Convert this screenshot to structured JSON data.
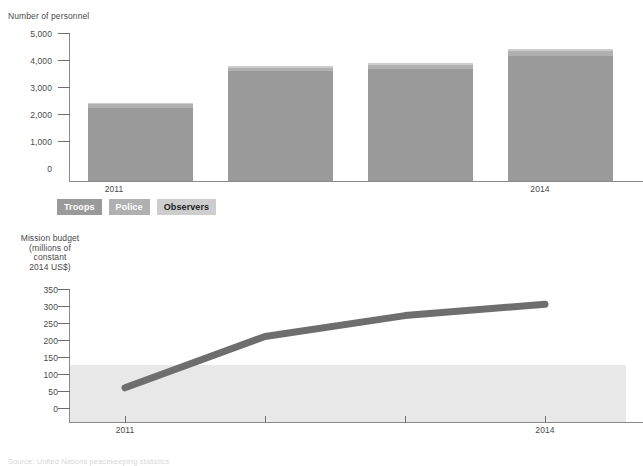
{
  "figure": {
    "source_note": "Source: United Nations peacekeeping statistics"
  },
  "bar_chart": {
    "ylabel": "Number of personnel",
    "yticks": [
      "5,000",
      "4,000",
      "3,000",
      "2,000",
      "1,000",
      "0"
    ],
    "xticks": [
      "2011",
      "",
      "",
      "2014"
    ],
    "legend": [
      {
        "label": "Troops",
        "color": "#9a9a9a"
      },
      {
        "label": "Police",
        "color": "#b0b0b0"
      },
      {
        "label": "Observers",
        "color": "#cdcdcd"
      }
    ]
  },
  "line_chart": {
    "ylabel": "Mission budget\n(millions of\nconstant\n2014 US$)",
    "yticks": [
      "350",
      "300",
      "250",
      "200",
      "150",
      "100",
      "50",
      "0"
    ],
    "xticks": [
      "2011",
      "",
      "",
      "2014"
    ]
  },
  "chart_data": [
    {
      "type": "bar",
      "id": "personnel-stacked-bar",
      "title": "",
      "ylabel": "Number of personnel",
      "xlabel": "",
      "categories": [
        "2011",
        "2012",
        "2013",
        "2014"
      ],
      "stacked": true,
      "series": [
        {
          "name": "Troops",
          "color": "#9a9a9a",
          "values": [
            2480,
            3700,
            3790,
            4230
          ]
        },
        {
          "name": "Police",
          "color": "#b0b0b0",
          "values": [
            110,
            130,
            140,
            150
          ]
        },
        {
          "name": "Observers",
          "color": "#cdcdcd",
          "values": [
            60,
            70,
            70,
            70
          ]
        }
      ],
      "totals": [
        2650,
        3900,
        4000,
        4450
      ],
      "ylim": [
        0,
        5000
      ],
      "ytick_values": [
        0,
        1000,
        2000,
        3000,
        4000,
        5000
      ],
      "grid": false,
      "legend_position": "below"
    },
    {
      "type": "line",
      "id": "mission-budget-line",
      "title": "",
      "ylabel": "Mission budget (millions of constant 2014 US$)",
      "xlabel": "",
      "x": [
        "2011",
        "2012",
        "2013",
        "2014"
      ],
      "series": [
        {
          "name": "Mission budget",
          "color": "#6e6e6e",
          "values": [
            90,
            225,
            280,
            310
          ]
        }
      ],
      "ylim": [
        0,
        350
      ],
      "ytick_values": [
        0,
        50,
        100,
        150,
        200,
        250,
        300,
        350
      ],
      "shaded_band": {
        "from": 0,
        "to": 150,
        "color": "#e8e8e8"
      },
      "grid": false,
      "legend_position": "none"
    }
  ]
}
